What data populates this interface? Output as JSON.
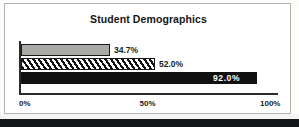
{
  "chart_data": {
    "type": "bar",
    "orientation": "horizontal",
    "title": "Student Demographics",
    "xlabel": "",
    "ylabel": "",
    "xlim": [
      0,
      100
    ],
    "xticks": [
      "0%",
      "50%",
      "100%"
    ],
    "xtick_values": [
      0,
      50,
      100
    ],
    "grid": false,
    "legend": "none",
    "categories": [
      "Series 1",
      "Series 2",
      "Series 3"
    ],
    "values": [
      34.7,
      52.0,
      92.0
    ],
    "data_labels": [
      "34.7%",
      "52.0%",
      "92.0%"
    ],
    "series_styles": [
      "solid-grey",
      "diagonal-hatch",
      "solid-black"
    ],
    "colors": {
      "series_1": "#a9a9a6",
      "series_2": "#ffffff",
      "series_3": "#111111",
      "outline": "#1a1a1a",
      "axis": "#2a2a2a",
      "frame": "#b2b2ae",
      "title_text": "#151515",
      "label_text": "#1b1b1b",
      "inverse_label_text": "#ffffff",
      "background": "#ffffff"
    }
  },
  "frame": {
    "title": "Student Demographics"
  },
  "axis": {
    "ticks": [
      {
        "label": "0%"
      },
      {
        "label": "50%"
      },
      {
        "label": "100%"
      }
    ]
  },
  "bars": [
    {
      "label": "34.7%",
      "value": 34.7
    },
    {
      "label": "52.0%",
      "value": 52.0
    },
    {
      "label": "92.0%",
      "value": 92.0
    }
  ]
}
